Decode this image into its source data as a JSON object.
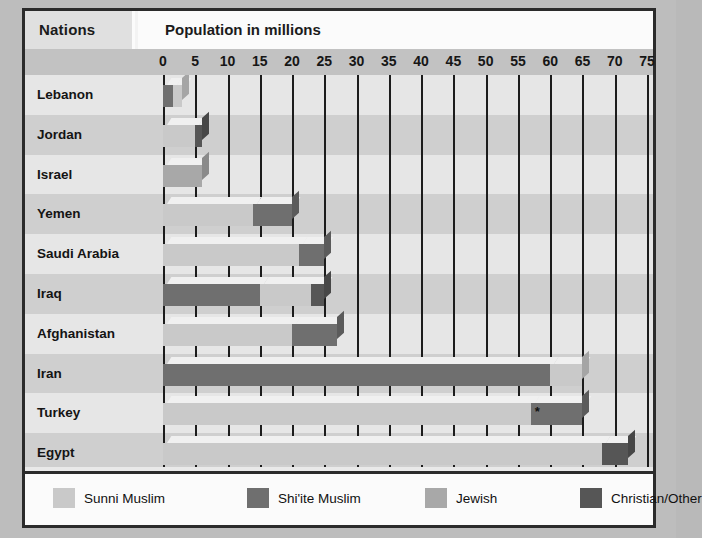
{
  "header": {
    "nations_label": "Nations",
    "population_label": "Population in millions"
  },
  "axis": {
    "ticks": [
      "0",
      "5",
      "10",
      "15",
      "20",
      "25",
      "30",
      "35",
      "40",
      "45",
      "50",
      "55",
      "60",
      "65",
      "70",
      "75"
    ],
    "min": 0,
    "max": 75,
    "step": 5
  },
  "legend": {
    "items": [
      {
        "label": "Sunni Muslim",
        "color": "#c9c9c9"
      },
      {
        "label": "Shi'ite Muslim",
        "color": "#6f6f6f"
      },
      {
        "label": "Jewish",
        "color": "#a8a8a8"
      },
      {
        "label": "Christian/Other",
        "color": "#565656"
      }
    ]
  },
  "annotation": {
    "turkey_marker": "*"
  },
  "chart_data": {
    "type": "bar",
    "orientation": "horizontal",
    "stacked": true,
    "title": "Population in millions",
    "xlabel": "Population in millions",
    "ylabel": "Nations",
    "xlim": [
      0,
      75
    ],
    "grid": true,
    "legend_position": "bottom",
    "categories": [
      "Lebanon",
      "Jordan",
      "Israel",
      "Yemen",
      "Saudi Arabia",
      "Iraq",
      "Afghanistan",
      "Iran",
      "Turkey",
      "Egypt"
    ],
    "series": [
      {
        "name": "Sunni Muslim",
        "color": "#c9c9c9",
        "values": [
          1.5,
          5.0,
          0.0,
          14.0,
          21.0,
          8.0,
          20.0,
          5.0,
          57.0,
          68.0
        ]
      },
      {
        "name": "Shi'ite Muslim",
        "color": "#6f6f6f",
        "values": [
          1.5,
          0.0,
          0.0,
          6.0,
          4.0,
          15.0,
          7.0,
          60.0,
          8.0,
          0.0
        ]
      },
      {
        "name": "Jewish",
        "color": "#a8a8a8",
        "values": [
          0.0,
          0.0,
          6.0,
          0.0,
          0.0,
          0.0,
          0.0,
          0.0,
          0.0,
          0.0
        ]
      },
      {
        "name": "Christian/Other",
        "color": "#565656",
        "values": [
          0.0,
          1.0,
          0.0,
          0.0,
          0.0,
          2.0,
          0.0,
          0.0,
          0.0,
          4.0
        ]
      }
    ],
    "bars": [
      {
        "nation": "Lebanon",
        "total": 3.0,
        "segments": [
          {
            "series": "Shi'ite Muslim",
            "start": 0.0,
            "end": 1.5
          },
          {
            "series": "Sunni Muslim",
            "start": 1.5,
            "end": 3.0
          }
        ]
      },
      {
        "nation": "Jordan",
        "total": 6.0,
        "segments": [
          {
            "series": "Sunni Muslim",
            "start": 0.0,
            "end": 5.0
          },
          {
            "series": "Christian/Other",
            "start": 5.0,
            "end": 6.0
          }
        ]
      },
      {
        "nation": "Israel",
        "total": 6.0,
        "segments": [
          {
            "series": "Jewish",
            "start": 0.0,
            "end": 6.0
          }
        ]
      },
      {
        "nation": "Yemen",
        "total": 20.0,
        "segments": [
          {
            "series": "Sunni Muslim",
            "start": 0.0,
            "end": 14.0
          },
          {
            "series": "Shi'ite Muslim",
            "start": 14.0,
            "end": 20.0
          }
        ]
      },
      {
        "nation": "Saudi Arabia",
        "total": 25.0,
        "segments": [
          {
            "series": "Sunni Muslim",
            "start": 0.0,
            "end": 21.0
          },
          {
            "series": "Shi'ite Muslim",
            "start": 21.0,
            "end": 25.0
          }
        ]
      },
      {
        "nation": "Iraq",
        "total": 25.0,
        "segments": [
          {
            "series": "Shi'ite Muslim",
            "start": 0.0,
            "end": 15.0
          },
          {
            "series": "Sunni Muslim",
            "start": 15.0,
            "end": 23.0
          },
          {
            "series": "Christian/Other",
            "start": 23.0,
            "end": 25.0
          }
        ]
      },
      {
        "nation": "Afghanistan",
        "total": 27.0,
        "segments": [
          {
            "series": "Sunni Muslim",
            "start": 0.0,
            "end": 20.0
          },
          {
            "series": "Shi'ite Muslim",
            "start": 20.0,
            "end": 27.0
          }
        ]
      },
      {
        "nation": "Iran",
        "total": 65.0,
        "segments": [
          {
            "series": "Shi'ite Muslim",
            "start": 0.0,
            "end": 60.0
          },
          {
            "series": "Sunni Muslim",
            "start": 60.0,
            "end": 65.0
          }
        ]
      },
      {
        "nation": "Turkey",
        "total": 65.0,
        "segments": [
          {
            "series": "Sunni Muslim",
            "start": 0.0,
            "end": 57.0
          },
          {
            "series": "Shi'ite Muslim",
            "start": 57.0,
            "end": 65.0,
            "marker": "*"
          }
        ]
      },
      {
        "nation": "Egypt",
        "total": 72.0,
        "segments": [
          {
            "series": "Sunni Muslim",
            "start": 0.0,
            "end": 68.0
          },
          {
            "series": "Christian/Other",
            "start": 68.0,
            "end": 72.0
          }
        ]
      }
    ]
  }
}
